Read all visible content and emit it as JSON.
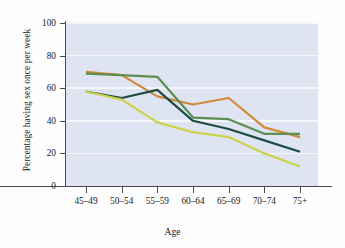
{
  "chart_data": {
    "type": "line",
    "title": "",
    "xlabel": "Age",
    "ylabel": "Percentage having sex once per week",
    "categories": [
      "45–49",
      "50–54",
      "55–59",
      "60–64",
      "65–69",
      "70–74",
      "75+"
    ],
    "ylim": [
      0,
      100
    ],
    "yticks": [
      0,
      20,
      40,
      60,
      80,
      100
    ],
    "grid": "horizontal",
    "legend": "none",
    "plot_background": "#dee4f1",
    "gridline_color": "#f4f7fc",
    "series": [
      {
        "name": "series-orange",
        "color": "#d0893b",
        "values": [
          70,
          68,
          55,
          50,
          54,
          36,
          30
        ]
      },
      {
        "name": "series-green",
        "color": "#5c8f4f",
        "values": [
          69,
          68,
          67,
          42,
          41,
          32,
          32
        ]
      },
      {
        "name": "series-dark-teal",
        "color": "#1d4c45",
        "values": [
          58,
          54,
          59,
          40,
          35,
          28,
          21
        ]
      },
      {
        "name": "series-yellow-green",
        "color": "#cdd24b",
        "values": [
          58,
          53,
          39,
          33,
          30,
          20,
          12
        ]
      }
    ]
  },
  "axes": {
    "y_tick_labels": [
      "0",
      "20",
      "40",
      "60",
      "80",
      "100"
    ],
    "x_tick_labels": [
      "45–49",
      "50–54",
      "55–59",
      "60–64",
      "65–69",
      "70–74",
      "75+"
    ],
    "y_axis_title": "Percentage having sex once per week",
    "x_axis_title": "Age"
  }
}
